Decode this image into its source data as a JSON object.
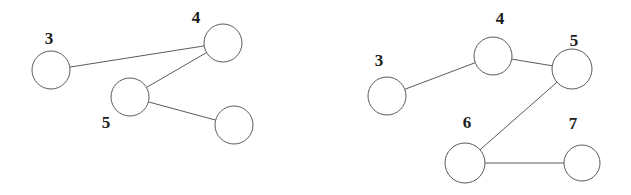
{
  "diagram": {
    "background_color": "#ffffff",
    "stroke_color": "#5a5a5a",
    "label_color": "#1c1c1c",
    "node_fill": "#ffffff",
    "graphs": [
      {
        "name": "left-graph",
        "nodes": [
          {
            "id": "3",
            "label": "3",
            "cx": 51,
            "cy": 70,
            "r": 19,
            "lx": 49,
            "ly": 44
          },
          {
            "id": "4",
            "label": "4",
            "cx": 223,
            "cy": 43,
            "r": 19,
            "lx": 196,
            "ly": 23
          },
          {
            "id": "5",
            "label": "5",
            "cx": 130,
            "cy": 97,
            "r": 19,
            "lx": 106,
            "ly": 128
          },
          {
            "id": "blank",
            "label": "",
            "cx": 234,
            "cy": 125,
            "r": 19,
            "lx": 0,
            "ly": 0
          }
        ],
        "edges": [
          [
            "3",
            "4"
          ],
          [
            "4",
            "5"
          ],
          [
            "5",
            "blank"
          ]
        ]
      },
      {
        "name": "right-graph",
        "nodes": [
          {
            "id": "3",
            "label": "3",
            "cx": 387,
            "cy": 96,
            "r": 19,
            "lx": 379,
            "ly": 66
          },
          {
            "id": "4",
            "label": "4",
            "cx": 493,
            "cy": 56,
            "r": 19,
            "lx": 500,
            "ly": 24
          },
          {
            "id": "5",
            "label": "5",
            "cx": 572,
            "cy": 69,
            "r": 20,
            "lx": 574,
            "ly": 46
          },
          {
            "id": "6",
            "label": "6",
            "cx": 465,
            "cy": 163,
            "r": 20,
            "lx": 467,
            "ly": 128
          },
          {
            "id": "7",
            "label": "7",
            "cx": 582,
            "cy": 163,
            "r": 18,
            "lx": 573,
            "ly": 129
          }
        ],
        "edges": [
          [
            "3",
            "4"
          ],
          [
            "4",
            "5"
          ],
          [
            "5",
            "6"
          ],
          [
            "6",
            "7"
          ]
        ]
      }
    ]
  }
}
